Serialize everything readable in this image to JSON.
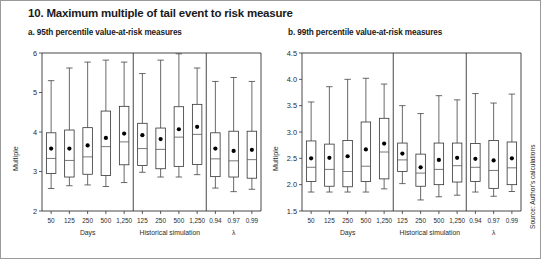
{
  "figure": {
    "title": "10. Maximum multiple of tail event to risk measure",
    "source": "Source: Author's calculations",
    "panel_a_title": "a. 95th percentile value-at-risk measures",
    "panel_b_title": "b. 99th percentile value-at-risk measures"
  },
  "chart_data": [
    {
      "type": "boxplot",
      "panel": "a",
      "title": "a. 95th percentile value-at-risk measures",
      "xlabel": "",
      "ylabel": "Multiple",
      "ylim": [
        2,
        6
      ],
      "yticks": [
        2,
        3,
        4,
        5,
        6
      ],
      "ytick_labels": [
        "2",
        "3",
        "4",
        "5",
        "6"
      ],
      "grid": false,
      "legend": "none",
      "groups": [
        {
          "label": "Days",
          "categories": [
            "50",
            "125",
            "250",
            "500",
            "1,250"
          ],
          "boxes": [
            {
              "category": "50",
              "min": 2.57,
              "q1": 2.95,
              "median": 3.33,
              "q3": 3.98,
              "max": 5.3,
              "mean": 3.58
            },
            {
              "category": "125",
              "min": 2.64,
              "q1": 2.86,
              "median": 3.28,
              "q3": 4.05,
              "max": 5.62,
              "mean": 3.58
            },
            {
              "category": "250",
              "min": 2.66,
              "q1": 2.93,
              "median": 3.37,
              "q3": 4.11,
              "max": 5.77,
              "mean": 3.66
            },
            {
              "category": "500",
              "min": 2.62,
              "q1": 2.9,
              "median": 3.63,
              "q3": 4.53,
              "max": 5.82,
              "mean": 3.85
            },
            {
              "category": "1,250",
              "min": 2.72,
              "q1": 3.17,
              "median": 3.75,
              "q3": 4.65,
              "max": 5.77,
              "mean": 3.96
            }
          ]
        },
        {
          "label": "Historical simulation",
          "categories": [
            "125",
            "250",
            "500",
            "1,250"
          ],
          "boxes": [
            {
              "category": "125",
              "min": 2.98,
              "q1": 3.15,
              "median": 3.58,
              "q3": 4.22,
              "max": 5.48,
              "mean": 3.92
            },
            {
              "category": "250",
              "min": 2.86,
              "q1": 3.07,
              "median": 3.56,
              "q3": 4.1,
              "max": 5.82,
              "mean": 3.82
            },
            {
              "category": "500",
              "min": 2.86,
              "q1": 3.13,
              "median": 3.87,
              "q3": 4.64,
              "max": 5.98,
              "mean": 4.07
            },
            {
              "category": "1,250",
              "min": 2.92,
              "q1": 3.18,
              "median": 3.94,
              "q3": 4.7,
              "max": 5.62,
              "mean": 4.13
            }
          ]
        },
        {
          "label": "λ",
          "categories": [
            "0.94",
            "0.97",
            "0.99"
          ],
          "boxes": [
            {
              "category": "0.94",
              "min": 2.58,
              "q1": 2.87,
              "median": 3.32,
              "q3": 3.98,
              "max": 5.28,
              "mean": 3.58
            },
            {
              "category": "0.97",
              "min": 2.49,
              "q1": 2.86,
              "median": 3.27,
              "q3": 4.02,
              "max": 5.38,
              "mean": 3.52
            },
            {
              "category": "0.99",
              "min": 2.55,
              "q1": 2.83,
              "median": 3.3,
              "q3": 4.02,
              "max": 5.28,
              "mean": 3.55
            }
          ]
        }
      ]
    },
    {
      "type": "boxplot",
      "panel": "b",
      "title": "b. 99th percentile value-at-risk measures",
      "xlabel": "",
      "ylabel": "Multiple",
      "ylim": [
        1.5,
        4.5
      ],
      "yticks": [
        1.5,
        2.0,
        2.5,
        3.0,
        3.5,
        4.0,
        4.5
      ],
      "ytick_labels": [
        "1.5",
        "2.0",
        "2.5",
        "3.0",
        "3.5",
        "4.0",
        "4.5"
      ],
      "grid": false,
      "legend": "none",
      "groups": [
        {
          "label": "Days",
          "categories": [
            "50",
            "125",
            "250",
            "500",
            "1,250"
          ],
          "boxes": [
            {
              "category": "50",
              "min": 1.86,
              "q1": 2.06,
              "median": 2.33,
              "q3": 2.83,
              "max": 3.57,
              "mean": 2.5
            },
            {
              "category": "125",
              "min": 1.86,
              "q1": 1.97,
              "median": 2.29,
              "q3": 2.77,
              "max": 3.86,
              "mean": 2.51
            },
            {
              "category": "250",
              "min": 1.86,
              "q1": 1.96,
              "median": 2.25,
              "q3": 2.84,
              "max": 4.0,
              "mean": 2.54
            },
            {
              "category": "500",
              "min": 1.86,
              "q1": 2.06,
              "median": 2.35,
              "q3": 3.19,
              "max": 4.02,
              "mean": 2.67
            },
            {
              "category": "1,250",
              "min": 1.92,
              "q1": 2.11,
              "median": 2.62,
              "q3": 3.26,
              "max": 3.91,
              "mean": 2.78
            }
          ]
        },
        {
          "label": "Historical simulation",
          "categories": [
            "125",
            "250",
            "500",
            "1,250"
          ],
          "boxes": [
            {
              "category": "125",
              "min": 2.02,
              "q1": 2.25,
              "median": 2.47,
              "q3": 2.79,
              "max": 3.5,
              "mean": 2.59
            },
            {
              "category": "250",
              "min": 1.71,
              "q1": 1.97,
              "median": 2.22,
              "q3": 2.58,
              "max": 3.35,
              "mean": 2.33
            },
            {
              "category": "500",
              "min": 1.77,
              "q1": 2.0,
              "median": 2.29,
              "q3": 2.79,
              "max": 3.69,
              "mean": 2.47
            },
            {
              "category": "1,250",
              "min": 1.8,
              "q1": 2.05,
              "median": 2.36,
              "q3": 2.79,
              "max": 3.61,
              "mean": 2.51
            }
          ]
        },
        {
          "label": "λ",
          "categories": [
            "0.94",
            "0.97",
            "0.99"
          ],
          "boxes": [
            {
              "category": "0.94",
              "min": 1.86,
              "q1": 2.06,
              "median": 2.33,
              "q3": 2.78,
              "max": 3.73,
              "mean": 2.49
            },
            {
              "category": "0.97",
              "min": 1.78,
              "q1": 1.93,
              "median": 2.27,
              "q3": 2.84,
              "max": 3.55,
              "mean": 2.46
            },
            {
              "category": "0.99",
              "min": 1.87,
              "q1": 2.0,
              "median": 2.32,
              "q3": 2.81,
              "max": 3.72,
              "mean": 2.5
            }
          ]
        }
      ]
    }
  ]
}
